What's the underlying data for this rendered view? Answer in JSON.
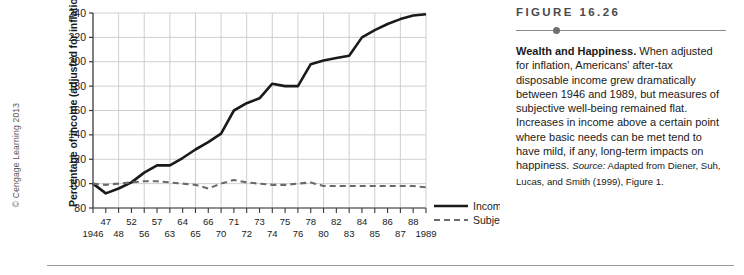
{
  "copyright": "© Cengage Learning 2013",
  "figure": {
    "number_label": "FIGURE 16.26",
    "title": "Wealth and Happiness.",
    "body": " When adjusted for inflation, Americans' after-tax disposable income grew dramatically between 1946 and 1989, but measures of subjective well-being remained flat. Increases in income above a certain point where basic needs can be met tend to have mild, if any, long-term impacts on happiness. ",
    "source_label": "Source:",
    "source_text": " Adapted from Diener, Suh, Lucas, and Smith (1999), Figure 1."
  },
  "chart_data": {
    "type": "line",
    "title": "",
    "xlabel": "",
    "ylabel": "Percentage of income (adjusted for inflation)",
    "ylim": [
      80,
      240
    ],
    "ytick_labels": [
      "80",
      "100",
      "120",
      "140",
      "160",
      "180",
      "200",
      "220",
      "240"
    ],
    "ytick_values": [
      80,
      100,
      120,
      140,
      160,
      180,
      200,
      220,
      240
    ],
    "grid": true,
    "legend_position": "right-bottom",
    "x_tick_labels_upper": [
      "",
      "47",
      "",
      "52",
      "",
      "57",
      "",
      "64",
      "",
      "66",
      "",
      "71",
      "",
      "73",
      "",
      "75",
      "",
      "78",
      "",
      "82",
      "",
      "84",
      "",
      "86",
      "",
      "88",
      ""
    ],
    "x_tick_labels_lower": [
      "1946",
      "",
      "48",
      "",
      "56",
      "",
      "63",
      "",
      "65",
      "",
      "70",
      "",
      "72",
      "",
      "74",
      "",
      "76",
      "",
      "80",
      "",
      "83",
      "",
      "85",
      "",
      "87",
      "",
      "1989"
    ],
    "categories": [
      "1946",
      "47",
      "48",
      "52",
      "56",
      "57",
      "63",
      "64",
      "65",
      "66",
      "70",
      "71",
      "72",
      "73",
      "74",
      "75",
      "76",
      "78",
      "80",
      "82",
      "83",
      "84",
      "85",
      "86",
      "87",
      "88",
      "1989"
    ],
    "series": [
      {
        "name": "Income",
        "style": "solid",
        "color": "#1a1a1a",
        "values": [
          100,
          92,
          96,
          101,
          109,
          115,
          115,
          121,
          128,
          134,
          141,
          160,
          166,
          170,
          182,
          180,
          180,
          198,
          201,
          203,
          205,
          220,
          226,
          231,
          235,
          238,
          239
        ]
      },
      {
        "name": "Subjective well-being",
        "style": "dashed",
        "color": "#6a6a6c",
        "values": [
          100,
          99,
          100,
          101,
          102,
          102,
          101,
          100,
          99,
          96,
          100,
          103,
          101,
          100,
          99,
          99,
          100,
          101,
          98,
          98,
          98,
          98,
          98,
          98,
          98,
          98,
          97
        ]
      }
    ],
    "legend": [
      {
        "label": "Income",
        "style": "solid"
      },
      {
        "label": "Subjective well-being",
        "style": "dashed"
      }
    ]
  }
}
